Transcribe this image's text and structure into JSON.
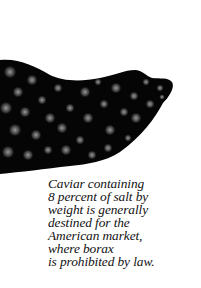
{
  "photo": {
    "subject": "caviar-closeup",
    "colors": {
      "background": "#000000",
      "egg_highlight": "#9a9a9a"
    }
  },
  "pull_quote": {
    "lines": [
      "Caviar containing",
      "8 percent of salt by",
      "weight is generally",
      "destined for the",
      "American market,",
      "where borax",
      "is prohibited by law."
    ],
    "color": "#111111"
  }
}
